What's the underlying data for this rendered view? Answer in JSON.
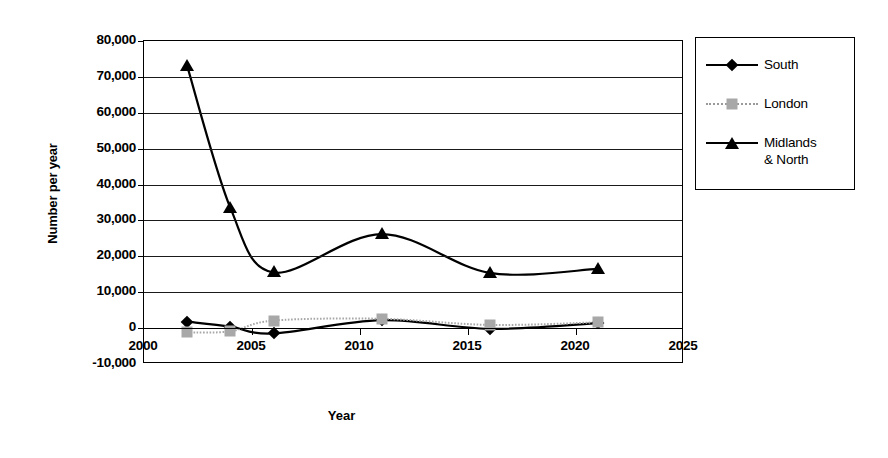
{
  "chart_data": {
    "type": "line",
    "title": "",
    "xlabel": "Year",
    "ylabel": "Number per year",
    "xlim": [
      2000,
      2025
    ],
    "ylim": [
      -10000,
      80000
    ],
    "xticks": [
      "2000",
      "2005",
      "2010",
      "2015",
      "2020",
      "2025"
    ],
    "xtick_values": [
      2000,
      2005,
      2010,
      2015,
      2020,
      2025
    ],
    "yticks": [
      "-10,000",
      "0",
      "10,000",
      "20,000",
      "30,000",
      "40,000",
      "50,000",
      "60,000",
      "70,000",
      "80,000"
    ],
    "ytick_values": [
      -10000,
      0,
      10000,
      20000,
      30000,
      40000,
      50000,
      60000,
      70000,
      80000
    ],
    "grid": "horizontal",
    "legend_position": "right",
    "x": [
      2002,
      2004,
      2006,
      2011,
      2016,
      2021
    ],
    "series": [
      {
        "name": "South",
        "marker": "diamond",
        "color": "#000000",
        "line": "solid",
        "values": [
          1800,
          400,
          -1500,
          2200,
          -200,
          1400
        ]
      },
      {
        "name": "London",
        "marker": "square",
        "color": "#a8a8a8",
        "line": "dotted",
        "values": [
          -1200,
          -900,
          2100,
          2600,
          900,
          1600
        ]
      },
      {
        "name": "Midlands & North",
        "marker": "triangle",
        "color": "#000000",
        "line": "solid",
        "values": [
          73000,
          33500,
          15500,
          26200,
          15400,
          16500
        ]
      }
    ]
  },
  "legend": {
    "title": "",
    "items": [
      {
        "label": "South",
        "marker": "diamond-icon",
        "line": "solid"
      },
      {
        "label": "London",
        "marker": "square-icon",
        "line": "dotted"
      },
      {
        "label": "Midlands\n& North",
        "marker": "triangle-icon",
        "line": "solid"
      }
    ]
  },
  "axes": {
    "y_title": "Number per year",
    "x_title": "Year"
  }
}
